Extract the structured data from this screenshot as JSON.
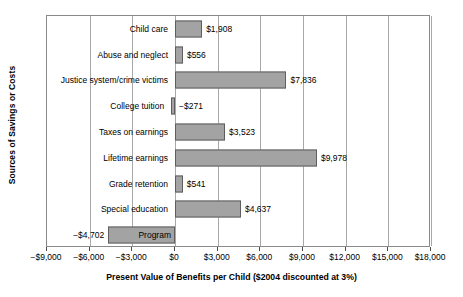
{
  "chart_data": {
    "type": "bar",
    "orientation": "horizontal",
    "title": "",
    "xlabel": "Present Value of Benefits per Child ($2004 discounted at 3%)",
    "ylabel": "Sources of Savings or Costs",
    "xlim": [
      -9000,
      18000
    ],
    "xtick_step": 3000,
    "grid": true,
    "legend": "none",
    "bar_color": "#a3a3a3",
    "bar_border_color": "#5e5e5e",
    "xticks": [
      -9000,
      -6000,
      -3000,
      0,
      3000,
      6000,
      9000,
      12000,
      15000,
      18000
    ],
    "xticklabels": [
      "−$9,000",
      "−$6,000",
      "−$3,000",
      "$0",
      "$3,000",
      "$6,000",
      "$9,000",
      "$12,000",
      "$15,000",
      "$18,000"
    ],
    "categories": [
      "Child care",
      "Abuse and neglect",
      "Justice system/crime victims",
      "College tuition",
      "Taxes on earnings",
      "Lifetime earnings",
      "Grade retention",
      "Special education",
      "Program"
    ],
    "values": [
      1908,
      556,
      7836,
      -271,
      3523,
      9978,
      541,
      4637,
      -4702
    ],
    "data_labels": [
      "$1,908",
      "$556",
      "−$271",
      "$3,523",
      "$9,978",
      "$541",
      "$4,637",
      "−$4,702",
      "$7,836"
    ],
    "points": [
      {
        "category": "Child care",
        "value": 1908,
        "label": "$1,908",
        "label_side": "right"
      },
      {
        "category": "Abuse and neglect",
        "value": 556,
        "label": "$556",
        "label_side": "right"
      },
      {
        "category": "Justice system/crime victims",
        "value": 7836,
        "label": "$7,836",
        "label_side": "right"
      },
      {
        "category": "College tuition",
        "value": -271,
        "label": "−$271",
        "label_side": "right"
      },
      {
        "category": "Taxes on earnings",
        "value": 3523,
        "label": "$3,523",
        "label_side": "right"
      },
      {
        "category": "Lifetime earnings",
        "value": 9978,
        "label": "$9,978",
        "label_side": "right"
      },
      {
        "category": "Grade retention",
        "value": 541,
        "label": "$541",
        "label_side": "right"
      },
      {
        "category": "Special education",
        "value": 4637,
        "label": "$4,637",
        "label_side": "right"
      },
      {
        "category": "Program",
        "value": -4702,
        "label": "−$4,702",
        "label_side": "left",
        "label_inside_bar": "Program"
      }
    ]
  },
  "axes": {
    "y_title": "Sources of Savings or Costs",
    "x_title": "Present Value of Benefits per Child ($2004 discounted at 3%)"
  },
  "labels": {
    "cat_0": "Child care",
    "cat_1": "Abuse and neglect",
    "cat_2": "Justice system/crime victims",
    "cat_3": "College tuition",
    "cat_4": "Taxes on earnings",
    "cat_5": "Lifetime earnings",
    "cat_6": "Grade retention",
    "cat_7": "Special education",
    "cat_8": "Program",
    "val_0": "$1,908",
    "val_1": "$556",
    "val_2": "$7,836",
    "val_3": "−$271",
    "val_4": "$3,523",
    "val_5": "$9,978",
    "val_6": "$541",
    "val_7": "$4,637",
    "val_8": "−$4,702",
    "tick_0": "−$9,000",
    "tick_1": "−$6,000",
    "tick_2": "−$3,000",
    "tick_3": "$0",
    "tick_4": "$3,000",
    "tick_5": "$6,000",
    "tick_6": "$9,000",
    "tick_7": "$12,000",
    "tick_8": "$15,000",
    "tick_9": "$18,000"
  }
}
